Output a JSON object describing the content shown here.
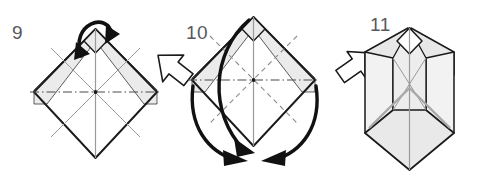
{
  "diagram": {
    "background_color": "#ffffff",
    "line_color": "#1a1a1a",
    "fold_line_color": "#8a8a8a",
    "paper_fill": "#ffffff",
    "shaded_fill": "#ebebeb",
    "shaded_fill_dark": "#dcdcdc",
    "number_color": "#58585a"
  },
  "steps": [
    {
      "id": "step-9",
      "number": "9",
      "shape": "square-base-diamond",
      "description": "Diamond shaped folded paper with horizontal dash-dot center line and shaded upper bands",
      "action_arrow": {
        "name": "fold-down-loop-arrow",
        "type": "loop-double-arrowhead",
        "direction": "down",
        "count": 2
      }
    },
    {
      "id": "step-10",
      "number": "10",
      "shape": "square-base-diamond-with-creases",
      "description": "Diamond with dashed diagonal valley folds and dash-dot horizontal crease; flaps swing down to the bottom point",
      "action_arrow": {
        "name": "swing-flaps-down-arrows",
        "type": "curved-sweep",
        "direction": "down-to-bottom-point",
        "count": 3
      }
    },
    {
      "id": "step-11",
      "number": "11",
      "shape": "three-dimensional-result",
      "description": "Resulting three-dimensional shape with two raised side arms and a pointed bottom"
    }
  ],
  "separators": [
    {
      "name": "transition-arrow-9-to-10",
      "direction": "down-right",
      "style": "hollow-outline"
    },
    {
      "name": "transition-arrow-10-to-11",
      "direction": "down-left",
      "style": "hollow-outline"
    }
  ]
}
